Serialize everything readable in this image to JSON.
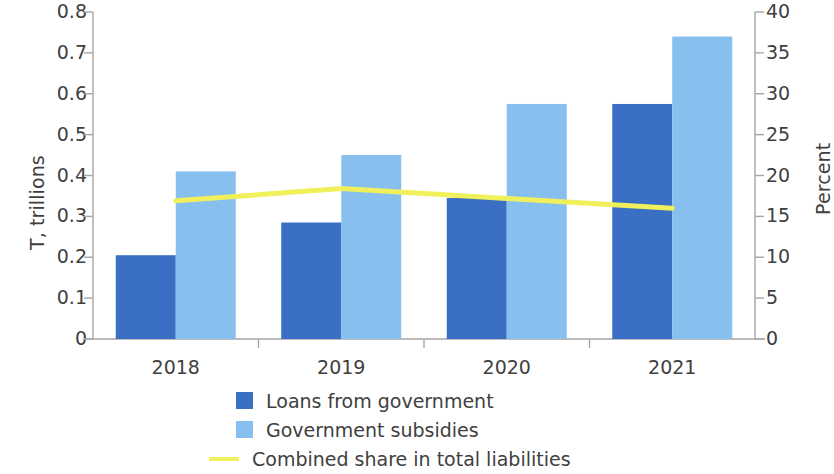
{
  "chart_data": {
    "type": "bar",
    "title": "",
    "subtitle": "",
    "categories": [
      "2018",
      "2019",
      "2020",
      "2021"
    ],
    "series": [
      {
        "name": "Loans from government",
        "type": "bar",
        "axis": "left",
        "color": "#3a6fc4",
        "values": [
          0.205,
          0.285,
          0.345,
          0.575
        ]
      },
      {
        "name": "Government subsidies",
        "type": "bar",
        "axis": "left",
        "color": "#87bfef",
        "values": [
          0.41,
          0.45,
          0.575,
          0.74
        ]
      },
      {
        "name": "Combined share in total liabilities",
        "type": "line",
        "axis": "right",
        "color": "#f0f05c",
        "values": [
          16.9,
          18.4,
          17.2,
          16.0
        ]
      }
    ],
    "xlabel": "",
    "ylabel": "T, trillions",
    "ylabel_right": "Percent",
    "ylim": [
      0,
      0.8
    ],
    "ylim_right": [
      0,
      40
    ],
    "yticks_left": [
      "0",
      "0.1",
      "0.2",
      "0.3",
      "0.4",
      "0.5",
      "0.6",
      "0.7",
      "0.8"
    ],
    "yticks_left_values": [
      0,
      0.1,
      0.2,
      0.3,
      0.4,
      0.5,
      0.6,
      0.7,
      0.8
    ],
    "yticks_right": [
      "0",
      "5",
      "10",
      "15",
      "20",
      "25",
      "30",
      "35",
      "40"
    ],
    "yticks_right_values": [
      0,
      5,
      10,
      15,
      20,
      25,
      30,
      35,
      40
    ],
    "grid": false,
    "legend_position": "bottom"
  },
  "axes": {
    "left_title": "T, trillions",
    "right_title": "Percent"
  },
  "legend": {
    "items": [
      {
        "label": "Loans from government",
        "marker": "square",
        "color": "#3a6fc4"
      },
      {
        "label": "Government subsidies",
        "marker": "square",
        "color": "#87bfef"
      },
      {
        "label": "Combined share in total liabilities",
        "marker": "line",
        "color": "#f0f05c"
      }
    ]
  },
  "colors": {
    "loans": "#3a6fc4",
    "subsidies": "#87bfef",
    "line": "#f0f05c",
    "axis": "#a6a6a6",
    "text": "#404040"
  }
}
